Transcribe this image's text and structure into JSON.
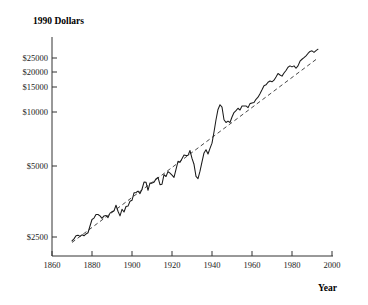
{
  "chart_data": {
    "type": "line",
    "title": "",
    "xlabel": "Year",
    "ylabel": "1990 Dollars",
    "yscale": "log",
    "xscale": "linear",
    "xlim": [
      1860,
      2000
    ],
    "ylim": [
      2100,
      28000
    ],
    "grid": false,
    "legend": null,
    "xticks": [
      1860,
      1880,
      1900,
      1920,
      1940,
      1960,
      1980,
      2000
    ],
    "xtick_labels": [
      "1860",
      "1880",
      "1900",
      "1920",
      "1940",
      "1960",
      "1980",
      "2000"
    ],
    "yticks": [
      2500,
      5000,
      10000,
      15000,
      20000,
      25000
    ],
    "ytick_labels": [
      "$2500",
      "$5000",
      "$10000",
      "$15000",
      "$20000",
      "$25000"
    ],
    "series": [
      {
        "name": "Real output per capita",
        "style": "solid",
        "color": "#1a1a1a",
        "x": [
          1870,
          1871,
          1872,
          1873,
          1874,
          1875,
          1876,
          1877,
          1878,
          1879,
          1880,
          1881,
          1882,
          1883,
          1884,
          1885,
          1886,
          1887,
          1888,
          1889,
          1890,
          1891,
          1892,
          1893,
          1894,
          1895,
          1896,
          1897,
          1898,
          1899,
          1900,
          1901,
          1902,
          1903,
          1904,
          1905,
          1906,
          1907,
          1908,
          1909,
          1910,
          1911,
          1912,
          1913,
          1914,
          1915,
          1916,
          1917,
          1918,
          1919,
          1920,
          1921,
          1922,
          1923,
          1924,
          1925,
          1926,
          1927,
          1928,
          1929,
          1930,
          1931,
          1932,
          1933,
          1934,
          1935,
          1936,
          1937,
          1938,
          1939,
          1940,
          1941,
          1942,
          1943,
          1944,
          1945,
          1946,
          1947,
          1948,
          1949,
          1950,
          1951,
          1952,
          1953,
          1954,
          1955,
          1956,
          1957,
          1958,
          1959,
          1960,
          1961,
          1962,
          1963,
          1964,
          1965,
          1966,
          1967,
          1968,
          1969,
          1970,
          1971,
          1972,
          1973,
          1974,
          1975,
          1976,
          1977,
          1978,
          1979,
          1980,
          1981,
          1982,
          1983,
          1984,
          1985,
          1986,
          1987,
          1988,
          1989,
          1990,
          1991,
          1992,
          1993
        ],
        "y": [
          2380,
          2440,
          2540,
          2560,
          2520,
          2570,
          2540,
          2600,
          2640,
          2880,
          3130,
          3190,
          3340,
          3340,
          3280,
          3180,
          3280,
          3300,
          3210,
          3400,
          3460,
          3500,
          3760,
          3480,
          3280,
          3570,
          3450,
          3700,
          3720,
          3960,
          4010,
          4410,
          4430,
          4510,
          4370,
          4620,
          5070,
          5060,
          4560,
          5010,
          5000,
          5060,
          5280,
          5380,
          4900,
          4930,
          5580,
          5440,
          5800,
          5680,
          5540,
          5380,
          5960,
          6620,
          6530,
          6850,
          7180,
          7140,
          7140,
          7600,
          6870,
          6370,
          5450,
          5300,
          5830,
          6570,
          7370,
          7680,
          7270,
          7820,
          8360,
          9650,
          11300,
          12900,
          13700,
          13300,
          11300,
          10900,
          11100,
          10900,
          11700,
          12400,
          12700,
          13100,
          12800,
          13500,
          13500,
          13500,
          13200,
          13900,
          14000,
          14100,
          14700,
          15100,
          15800,
          16600,
          17500,
          17700,
          18300,
          18600,
          18400,
          18800,
          19600,
          20500,
          20100,
          19800,
          20600,
          21300,
          22200,
          22600,
          22300,
          22600,
          21900,
          22600,
          24000,
          24600,
          25100,
          25700,
          26500,
          27200,
          27400,
          26900,
          27500,
          28000
        ],
        "note": "Rendered as a log-scale curve; values are real output per capita in 1990 dollars. Depression trough 1933, WWII peak 1944."
      },
      {
        "name": "Trend",
        "style": "dashed",
        "color": "#333333",
        "x": [
          1870,
          1993
        ],
        "y": [
          2330,
          25000
        ],
        "note": "Dashed exponential trend line on log scale."
      }
    ],
    "annotations": [
      {
        "label": "Great Depression trough",
        "year": 1933,
        "value": 5300
      },
      {
        "label": "WWII peak",
        "year": 1944,
        "value": 13700
      }
    ]
  },
  "plot": {
    "ylabel_text": "1990 Dollars",
    "xlabel_text": "Year"
  }
}
